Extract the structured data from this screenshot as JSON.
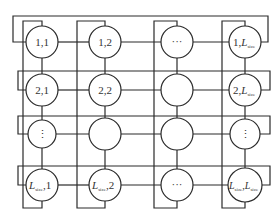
{
  "diagram": {
    "title": "",
    "line_color": "#2a2a2a",
    "background": "#ffffff",
    "grid": {
      "rows": 4,
      "cols": 4,
      "size_symbol": "L",
      "size_subscript": "size"
    },
    "nodes": [
      [
        {
          "label": "1,1"
        },
        {
          "label": "1,2"
        },
        {
          "label": "···"
        },
        {
          "prefix": "1,",
          "sym": "L",
          "sub": "size",
          "suffix": ""
        }
      ],
      [
        {
          "label": "2,1"
        },
        {
          "label": "2,2"
        },
        {
          "label": ""
        },
        {
          "prefix": "2,",
          "sym": "L",
          "sub": "size",
          "suffix": ""
        }
      ],
      [
        {
          "label": "⋮"
        },
        {
          "label": ""
        },
        {
          "label": ""
        },
        {
          "label": "⋮"
        }
      ],
      [
        {
          "prefix": "",
          "sym": "L",
          "sub": "size",
          "suffix": ",1"
        },
        {
          "prefix": "",
          "sym": "L",
          "sub": "size",
          "suffix": ",2"
        },
        {
          "label": "···"
        },
        {
          "prefix": "",
          "sym": "L",
          "sub": "size",
          "suffix": ",",
          "sym2": "L",
          "sub2": "size"
        }
      ]
    ]
  }
}
